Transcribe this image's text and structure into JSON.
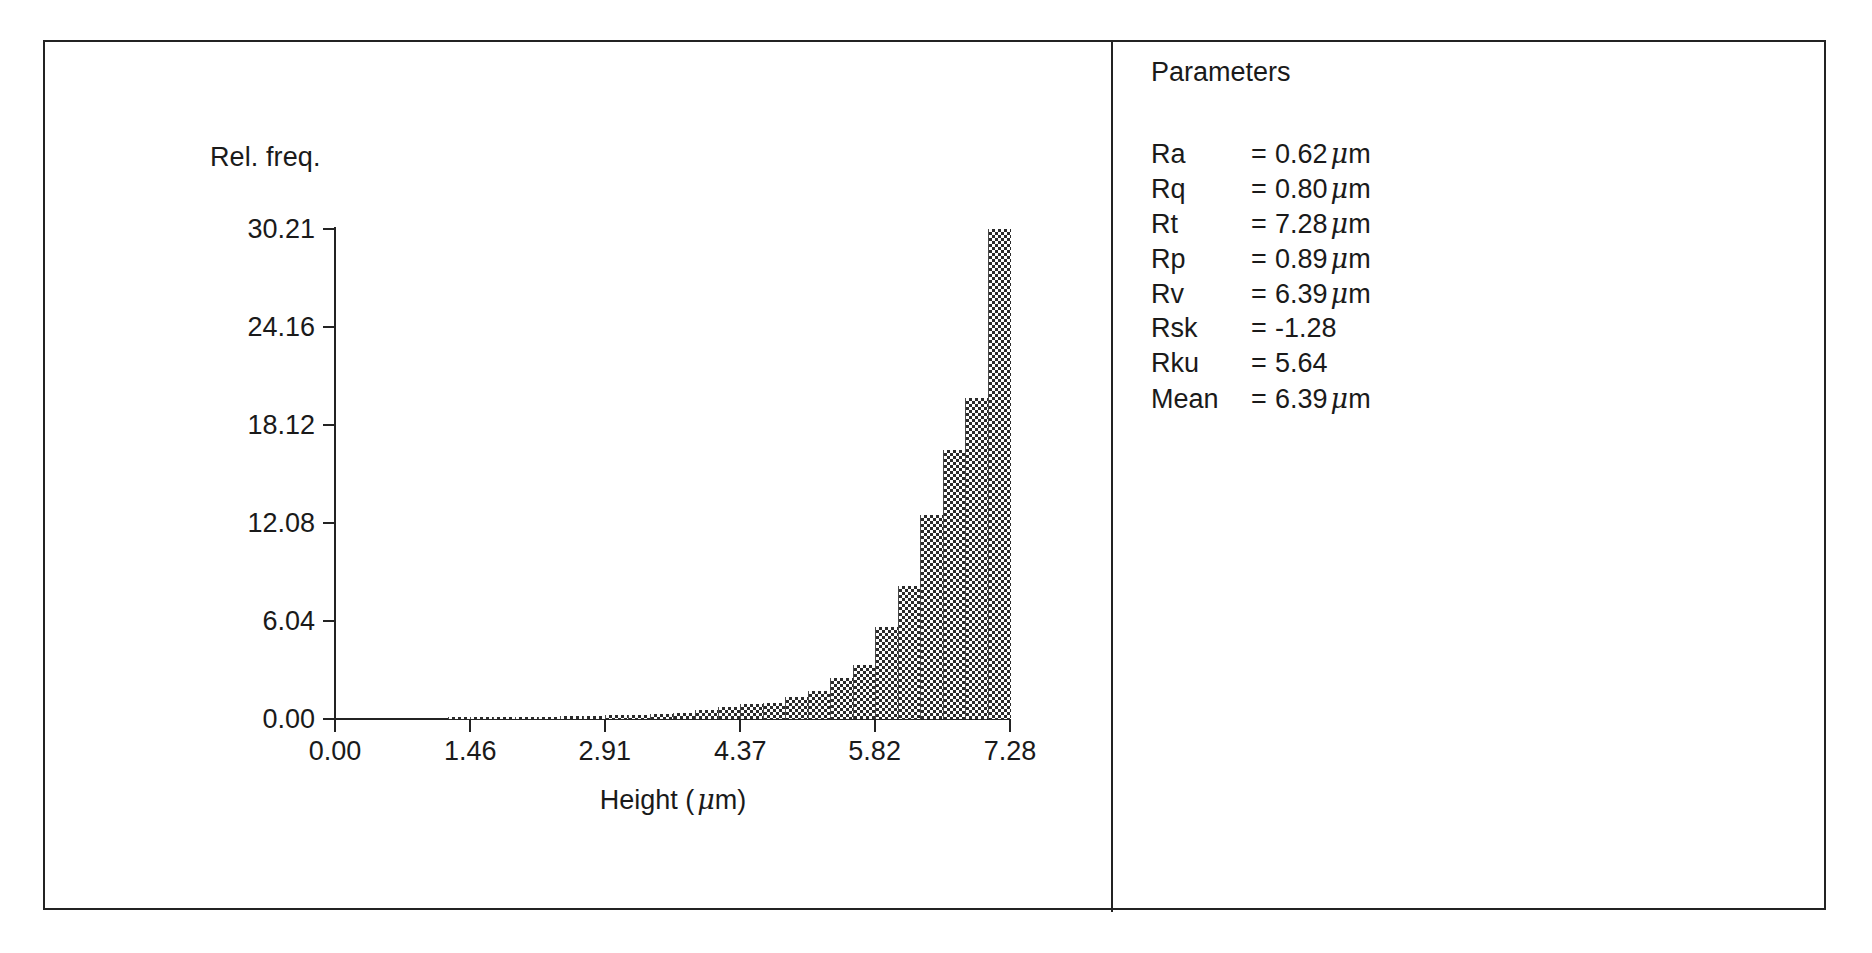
{
  "chart_data": {
    "type": "bar",
    "title": "",
    "xlabel": "Height (µm)",
    "ylabel": "Rel. freq.",
    "ylabel_display": "Rel. freq.",
    "xlabel_text": "Height (",
    "xlabel_unit": "m)",
    "xlim": [
      0.0,
      7.28
    ],
    "ylim": [
      0.0,
      30.21
    ],
    "grid": false,
    "legend": "none",
    "xticks": [
      "0.00",
      "1.46",
      "2.91",
      "4.37",
      "5.82",
      "7.28"
    ],
    "xtick_values": [
      0.0,
      1.46,
      2.91,
      4.37,
      5.82,
      7.28
    ],
    "yticks": [
      "0.00",
      "6.04",
      "12.08",
      "18.12",
      "24.16",
      "30.21"
    ],
    "ytick_values": [
      0.0,
      6.04,
      12.08,
      18.12,
      24.16,
      30.21
    ],
    "bin_width": 0.2427,
    "categories": [
      "0.00",
      "0.24",
      "0.49",
      "0.73",
      "0.97",
      "1.21",
      "1.46",
      "1.70",
      "1.94",
      "2.19",
      "2.43",
      "2.67",
      "2.91",
      "3.16",
      "3.40",
      "3.64",
      "3.88",
      "4.13",
      "4.37",
      "4.61",
      "4.85",
      "5.10",
      "5.34",
      "5.58",
      "5.82",
      "6.07",
      "6.31",
      "6.55",
      "6.79",
      "7.04"
    ],
    "values": [
      0.0,
      0.0,
      0.0,
      0.0,
      0.0,
      0.05,
      0.1,
      0.1,
      0.12,
      0.15,
      0.18,
      0.2,
      0.22,
      0.25,
      0.3,
      0.4,
      0.55,
      0.75,
      0.95,
      1.0,
      1.35,
      1.7,
      2.5,
      3.3,
      5.7,
      8.2,
      12.6,
      16.6,
      19.8,
      30.21
    ]
  },
  "parameters_panel": {
    "title": "Parameters",
    "rows": [
      {
        "name": "Ra",
        "eq": "=",
        "value": "0.62",
        "unit": "m",
        "has_mu": true
      },
      {
        "name": "Rq",
        "eq": "=",
        "value": "0.80",
        "unit": "m",
        "has_mu": true
      },
      {
        "name": "Rt",
        "eq": "=",
        "value": "7.28",
        "unit": "m",
        "has_mu": true
      },
      {
        "name": "Rp",
        "eq": "=",
        "value": "0.89",
        "unit": "m",
        "has_mu": true
      },
      {
        "name": "Rv",
        "eq": "=",
        "value": "6.39",
        "unit": "m",
        "has_mu": true
      },
      {
        "name": "Rsk",
        "eq": "=",
        "value": "-1.28",
        "unit": "",
        "has_mu": false
      },
      {
        "name": "Rku",
        "eq": "=",
        "value": "5.64",
        "unit": "",
        "has_mu": false
      },
      {
        "name": "Mean",
        "eq": "=",
        "value": "6.39",
        "unit": "m",
        "has_mu": true
      }
    ]
  },
  "colors": {
    "frame": "#232323",
    "text": "#1a1a1a",
    "bar_fill": "#2b2b2b",
    "background": "#ffffff"
  }
}
